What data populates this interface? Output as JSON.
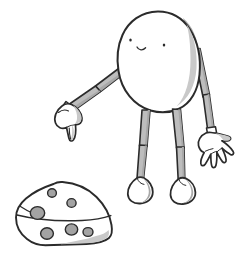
{
  "image": {
    "title": "Cartoon egg-headed figure pointing at a wedge of cheese",
    "medium": "hand-drawn ink and grey-wash illustration",
    "background_color": "#ffffff",
    "width": 242,
    "height": 258
  },
  "palette": {
    "background": "#ffffff",
    "ink_outline": "#2b2b2b",
    "body_fill": "#ffffff",
    "limb_fill": "#bdbdbd",
    "shadow_grey": "#a8a8a8",
    "light_grey": "#c9c9c9",
    "cheese_hole": "#a3a3a3"
  },
  "subjects": [
    {
      "name": "character",
      "label": "Egg-headed cartoon figure",
      "parts": [
        {
          "name": "head",
          "label": "Large oval egg-shaped head / body"
        },
        {
          "name": "left-eye",
          "label": "Left eye dot"
        },
        {
          "name": "right-eye",
          "label": "Right eye dot"
        },
        {
          "name": "mouth",
          "label": "Small curved smiling mouth"
        },
        {
          "name": "left-arm",
          "label": "Left arm bent at elbow, angled down-left"
        },
        {
          "name": "left-hand",
          "label": "Closed fist with index finger pointing down"
        },
        {
          "name": "right-arm",
          "label": "Right arm bent at elbow, hanging down-right"
        },
        {
          "name": "right-hand",
          "label": "Open hand with spread fingers"
        },
        {
          "name": "left-leg",
          "label": "Thin left leg with knee joint"
        },
        {
          "name": "right-leg",
          "label": "Thin right leg with knee joint"
        },
        {
          "name": "left-foot",
          "label": "Rounded left foot"
        },
        {
          "name": "right-foot",
          "label": "Rounded right foot"
        }
      ]
    },
    {
      "name": "cheese-wedge",
      "label": "Wedge of Swiss cheese with holes",
      "hole_count": 6,
      "parts": [
        {
          "name": "cheese-body",
          "label": "Triangular cheese wedge body"
        },
        {
          "name": "cheese-cut-face",
          "label": "Shaded cut face on the right side"
        },
        {
          "name": "cheese-rind-line",
          "label": "Curved rind line across the wedge"
        },
        {
          "name": "cheese-holes",
          "label": "Round holes in the cheese"
        }
      ]
    }
  ]
}
